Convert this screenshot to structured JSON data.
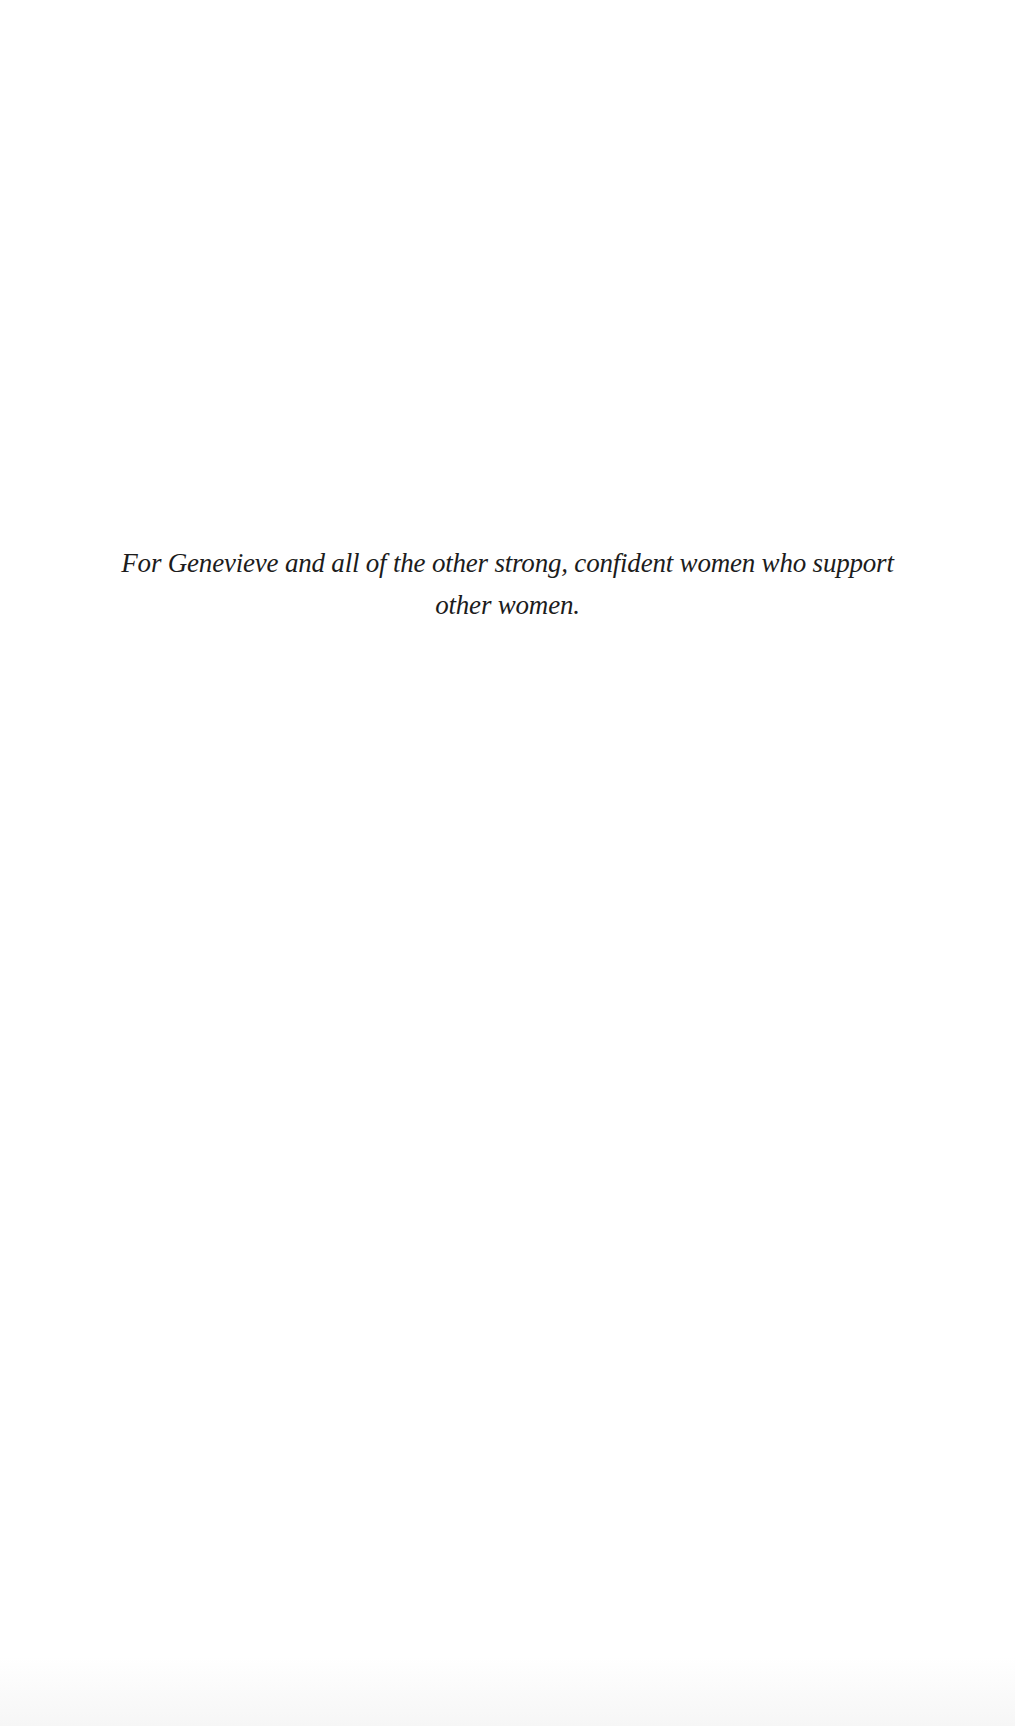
{
  "page": {
    "dedication": {
      "line1": "For Genevieve and all of the other strong, confident women who support",
      "line2": "other women."
    },
    "colors": {
      "background": "#ffffff",
      "text": "#1c1c1c"
    }
  }
}
